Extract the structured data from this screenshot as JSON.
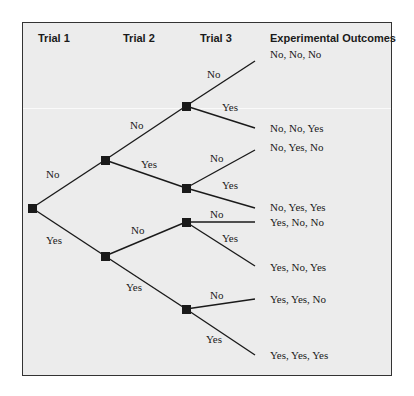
{
  "headers": {
    "trial1": "Trial 1",
    "trial2": "Trial 2",
    "trial3": "Trial 3",
    "outcomes": "Experimental Outcomes"
  },
  "branch_labels": {
    "t1_no": "No",
    "t1_yes": "Yes",
    "t2_no_no": "No",
    "t2_no_yes": "Yes",
    "t2_yes_no": "No",
    "t2_yes_yes": "Yes",
    "t3_nn_no": "No",
    "t3_nn_yes": "Yes",
    "t3_ny_no": "No",
    "t3_ny_yes": "Yes",
    "t3_yn_no": "No",
    "t3_yn_yes": "Yes",
    "t3_yy_no": "No",
    "t3_yy_yes": "Yes"
  },
  "outcomes": [
    "No, No, No",
    "No, No, Yes",
    "No, Yes, No",
    "No, Yes, Yes",
    "Yes, No, No",
    "Yes, No, Yes",
    "Yes, Yes, No",
    "Yes, Yes, Yes"
  ],
  "colors": {
    "background": "#ececec",
    "line": "#1a1a1a",
    "node": "#1a1a1a",
    "border": "#333333"
  }
}
